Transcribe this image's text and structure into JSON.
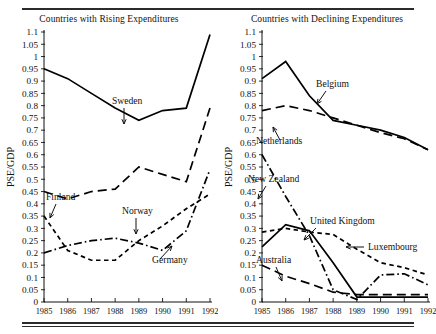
{
  "figure": {
    "panels": [
      {
        "id": "rising",
        "title": "Countries with Rising Expenditures",
        "xlabel": "Year",
        "ylabel": "PSE/GDP"
      },
      {
        "id": "declining",
        "title": "Countries with Declining Expenditures",
        "xlabel": "Year",
        "ylabel": "PSE/GDP"
      }
    ]
  },
  "axes": {
    "ytick_labels": [
      "1.1",
      "1.05",
      "1",
      "0.95",
      "0.9",
      "0.85",
      "0.8",
      "0.75",
      "0.7",
      "0.65",
      "0.6",
      "0.55",
      "0.5",
      "0.45",
      "0.4",
      "0.35",
      "0.3",
      "0.25",
      "0.2",
      "0.15",
      "0.1",
      "0.05",
      "0"
    ],
    "ytick_values": [
      1.1,
      1.05,
      1,
      0.95,
      0.9,
      0.85,
      0.8,
      0.75,
      0.7,
      0.65,
      0.6,
      0.55,
      0.5,
      0.45,
      0.4,
      0.35,
      0.3,
      0.25,
      0.2,
      0.15,
      0.1,
      0.05,
      0
    ],
    "xtick_labels": [
      "1985",
      "1986",
      "1987",
      "1988",
      "1989",
      "1990",
      "1991",
      "1992"
    ]
  },
  "chart_data": [
    {
      "type": "line",
      "title": "Countries with Rising Expenditures",
      "xlabel": "Year",
      "ylabel": "PSE/GDP",
      "x": [
        1985,
        1986,
        1987,
        1988,
        1989,
        1990,
        1991,
        1992
      ],
      "xlim": [
        1985,
        1992
      ],
      "ylim": [
        0,
        1.1
      ],
      "grid": false,
      "legend": "inline-annotations",
      "series": [
        {
          "name": "Sweden",
          "style": "solid",
          "values": [
            0.95,
            0.91,
            0.85,
            0.79,
            0.74,
            0.78,
            0.79,
            1.09
          ]
        },
        {
          "name": "Finland",
          "style": "long-dash",
          "values": [
            0.45,
            0.42,
            0.45,
            0.46,
            0.55,
            0.52,
            0.49,
            0.79
          ]
        },
        {
          "name": "Norway",
          "style": "short-dash",
          "values": [
            0.35,
            0.21,
            0.17,
            0.17,
            0.25,
            0.31,
            0.38,
            0.44
          ]
        },
        {
          "name": "Germany",
          "style": "dash-dot",
          "values": [
            0.2,
            0.23,
            0.25,
            0.26,
            0.24,
            0.21,
            0.29,
            0.54
          ]
        }
      ]
    },
    {
      "type": "line",
      "title": "Countries with Declining Expenditures",
      "xlabel": "Year",
      "ylabel": "PSE/GDP",
      "x": [
        1985,
        1986,
        1987,
        1988,
        1989,
        1990,
        1991,
        1992
      ],
      "xlim": [
        1985,
        1992
      ],
      "ylim": [
        0,
        1.1
      ],
      "grid": false,
      "legend": "inline-annotations",
      "series": [
        {
          "name": "Belgium",
          "style": "solid",
          "values": [
            0.91,
            0.98,
            0.84,
            0.74,
            0.72,
            0.7,
            0.67,
            0.62
          ]
        },
        {
          "name": "Netherlands",
          "style": "long-dash",
          "values": [
            0.78,
            0.8,
            0.78,
            0.75,
            0.72,
            0.69,
            0.665,
            0.62
          ]
        },
        {
          "name": "New Zealand",
          "style": "dash-dot",
          "values": [
            0.6,
            0.43,
            0.27,
            0.05,
            0.01,
            0.11,
            0.115,
            0.07
          ]
        },
        {
          "name": "United Kingdom",
          "style": "solid",
          "values": [
            0.225,
            0.315,
            0.29,
            0.16,
            0.02,
            0.02,
            0.02,
            0.02
          ]
        },
        {
          "name": "Luxembourg",
          "style": "short-dash",
          "values": [
            0.285,
            0.3,
            0.285,
            0.275,
            0.215,
            0.16,
            0.14,
            0.11
          ]
        },
        {
          "name": "Australia",
          "style": "long-dash",
          "values": [
            0.15,
            0.105,
            0.075,
            0.04,
            0.03,
            0.03,
            0.03,
            0.03
          ]
        }
      ]
    }
  ],
  "annotations": {
    "rising": [
      {
        "label": "Sweden",
        "x": 112,
        "y": 80
      },
      {
        "label": "Finland",
        "x": 46,
        "y": 176
      },
      {
        "label": "Norway",
        "x": 122,
        "y": 190
      },
      {
        "label": "Germany",
        "x": 152,
        "y": 239
      }
    ],
    "declining": [
      {
        "label": "Belgium",
        "x": 98,
        "y": 63
      },
      {
        "label": "Netherlands",
        "x": 38,
        "y": 120
      },
      {
        "label": "New Zealand",
        "x": 30,
        "y": 158
      },
      {
        "label": "United Kingdom",
        "x": 92,
        "y": 200
      },
      {
        "label": "Luxembourg",
        "x": 150,
        "y": 226
      },
      {
        "label": "Australia",
        "x": 38,
        "y": 239
      }
    ]
  }
}
